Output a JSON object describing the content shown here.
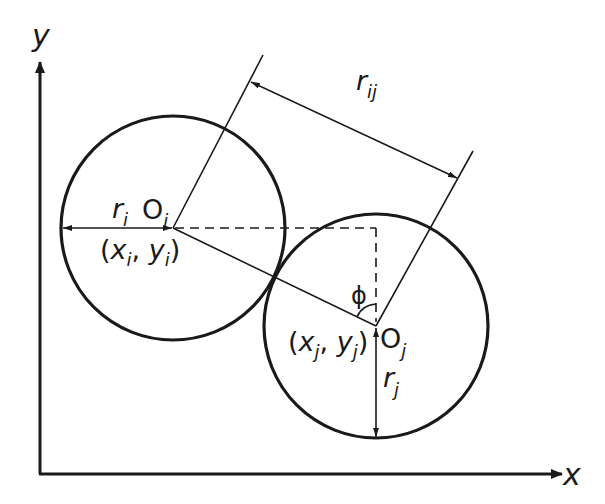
{
  "diagram": {
    "colors": {
      "stroke": "#1a1a1a",
      "background": "#ffffff"
    },
    "axes": {
      "x_label": "x",
      "y_label": "y"
    },
    "circle_i": {
      "center_label": "O",
      "center_sub": "i",
      "radius_label": "r",
      "radius_sub": "i",
      "coord_open": "(",
      "coord_x": "x",
      "coord_x_sub": "i",
      "coord_sep": ", ",
      "coord_y": "y",
      "coord_y_sub": "i",
      "coord_close": ")"
    },
    "circle_j": {
      "center_label": "O",
      "center_sub": "j",
      "radius_label": "r",
      "radius_sub": "j",
      "coord_open": "(",
      "coord_x": "x",
      "coord_x_sub": "j",
      "coord_sep": ", ",
      "coord_y": "y",
      "coord_y_sub": "j",
      "coord_close": ")"
    },
    "distance": {
      "label": "r",
      "sub": "ij"
    },
    "angle": {
      "label": "ϕ"
    }
  }
}
